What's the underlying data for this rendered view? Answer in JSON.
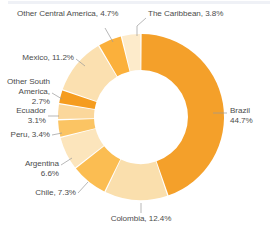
{
  "chart_data": {
    "type": "pie",
    "variant": "donut",
    "title": "",
    "subtitle": "",
    "xlabel": "",
    "ylabel": "",
    "legend_position": "callout-labels",
    "grid": false,
    "units": "percent",
    "start_angle_deg": 0,
    "direction": "clockwise",
    "total": 99.9,
    "categories": [
      "Brazil",
      "Colombia",
      "Chile",
      "Argentina",
      "Peru",
      "Ecuador",
      "Other South America",
      "Mexico",
      "Other Central America",
      "The Caribbean"
    ],
    "values": [
      44.7,
      12.4,
      7.3,
      6.6,
      3.4,
      3.1,
      2.7,
      11.2,
      4.7,
      3.8
    ],
    "colors": [
      "#f4a02a",
      "#fadfad",
      "#fbbd52",
      "#fce5bc",
      "#fbc463",
      "#fbd79b",
      "#f59c1e",
      "#fbe0b0",
      "#fbb03b",
      "#fdebcb"
    ],
    "slices": [
      {
        "label": "Brazil",
        "value": 44.7,
        "display": "Brazil\n44.7%",
        "color": "#f4a02a"
      },
      {
        "label": "Colombia",
        "value": 12.4,
        "display": "Colombia, 12.4%",
        "color": "#fadfad"
      },
      {
        "label": "Chile",
        "value": 7.3,
        "display": "Chile, 7.3%",
        "color": "#fbbd52"
      },
      {
        "label": "Argentina",
        "value": 6.6,
        "display": "Argentina\n6.6%",
        "color": "#fce5bc"
      },
      {
        "label": "Peru",
        "value": 3.4,
        "display": "Peru, 3.4%",
        "color": "#fbc463"
      },
      {
        "label": "Ecuador",
        "value": 3.1,
        "display": "Ecuador\n3.1%",
        "color": "#fbd79b"
      },
      {
        "label": "Other South America",
        "value": 2.7,
        "display": "Other South America, 2.7%",
        "color": "#f59c1e"
      },
      {
        "label": "Mexico",
        "value": 11.2,
        "display": "Mexico, 11.2%",
        "color": "#fbe0b0"
      },
      {
        "label": "Other Central America",
        "value": 4.7,
        "display": "Other Central America, 4.7%",
        "color": "#fbb03b"
      },
      {
        "label": "The Caribbean",
        "value": 3.8,
        "display": "The Caribbean, 3.8%",
        "color": "#fdebcb"
      }
    ]
  },
  "labels": {
    "brazil_line1": "Brazil",
    "brazil_line2": "44.7%",
    "colombia": "Colombia, 12.4%",
    "chile": "Chile, 7.3%",
    "argentina_line1": "Argentina",
    "argentina_line2": "6.6%",
    "peru": "Peru, 3.4%",
    "ecuador_line1": "Ecuador",
    "ecuador_line2": "3.1%",
    "other_south_america_line1": "Other South",
    "other_south_america_line2": "America, 2.7%",
    "mexico": "Mexico, 11.2%",
    "other_central_america": "Other Central America, 4.7%",
    "caribbean": "The Caribbean, 3.8%"
  },
  "style": {
    "text_color": "#4c4c4c",
    "leader_color": "#9a9a9a",
    "background": "#ffffff"
  }
}
